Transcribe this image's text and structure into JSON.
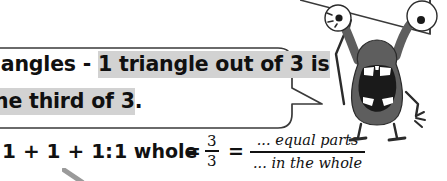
{
  "page": {
    "background_color": "#ffffff",
    "width": 447,
    "height": 181
  },
  "speech_bubble": {
    "style": "rounded-rectangle-with-tail",
    "border_color": "#3a3a3a",
    "fill_color": "#ffffff",
    "highlight_color": "#d2d2d2",
    "text_color": "#101010",
    "tail_direction": "right",
    "clipped_left_edge": true,
    "line_1": {
      "plain_prefix": "iangles - ",
      "highlighted": "1 triangle out of 3 is"
    },
    "line_2": {
      "highlighted": "ne third of 3",
      "plain_suffix": "."
    },
    "full_visible_text": "iangles - 1 triangle out of 3 is ne third of 3."
  },
  "equation_row": {
    "sum_label": "1 + 1 + 1:",
    "whole_label": "1 whole",
    "equals_1": "=",
    "fraction_numeric": {
      "numerator": "3",
      "denominator": "3"
    },
    "equals_2": "=",
    "fraction_words": {
      "numerator": "... equal parts",
      "denominator": "... in the whole"
    },
    "text_color": "#111111"
  },
  "monster": {
    "name": "cartoon-monster-character",
    "body_color": "#5e5e5e",
    "outline_color": "#2b2b2b",
    "eye_white": "#ffffff",
    "pupil_color": "#1a1a1a",
    "mouth_color": "#1a1a1a",
    "teeth_color": "#ffffff",
    "eye_count": 2,
    "expression": "open-mouth-shouting",
    "arms": 2,
    "legs": 2
  },
  "top_tail": {
    "name": "partial-speech-bubble-tail-offscreen",
    "border_color": "#3a3a3a"
  },
  "stray_mark": {
    "name": "partial-gray-stroke",
    "color": "#9a9a9a"
  }
}
